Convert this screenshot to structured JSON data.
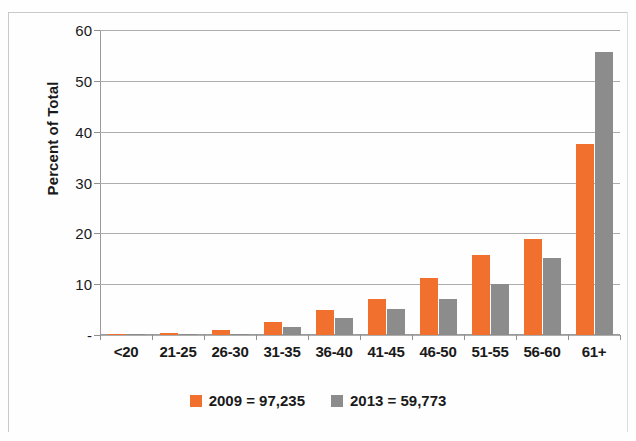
{
  "chart_data": {
    "type": "bar",
    "title": "",
    "subtitle": "",
    "xlabel": "",
    "ylabel": "Percent of Total",
    "categories": [
      "<20",
      "21-25",
      "26-30",
      "31-35",
      "36-40",
      "41-45",
      "46-50",
      "51-55",
      "56-60",
      "61+"
    ],
    "series": [
      {
        "name": "2009 = 97,235",
        "color": "#f2702e",
        "values": [
          0.1,
          0.3,
          0.9,
          2.5,
          4.9,
          7.0,
          11.3,
          15.8,
          18.8,
          37.6
        ]
      },
      {
        "name": "2013 = 59,773",
        "color": "#8c8c8c",
        "values": [
          0.05,
          0.1,
          0.2,
          1.5,
          3.3,
          5.1,
          7.0,
          10.1,
          15.1,
          55.6
        ]
      }
    ],
    "ylim": [
      0,
      60
    ],
    "ytick_values": [
      0,
      10,
      20,
      30,
      40,
      50,
      60
    ],
    "ytick_labels": [
      "-",
      "10",
      "20",
      "30",
      "40",
      "50",
      "60"
    ],
    "grid": "horizontal",
    "legend_position": "bottom"
  },
  "legend": {
    "items": [
      {
        "label": "2009 = 97,235",
        "color": "#f2702e"
      },
      {
        "label": "2013 = 59,773",
        "color": "#8c8c8c"
      }
    ]
  }
}
